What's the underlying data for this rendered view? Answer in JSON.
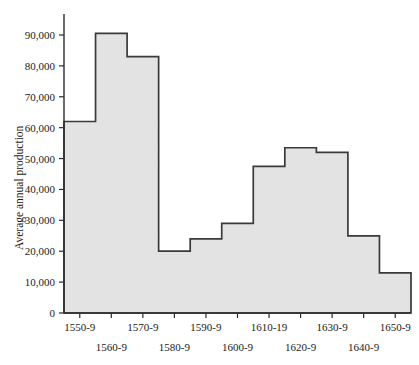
{
  "chart_data": {
    "type": "bar",
    "title": "",
    "subtitle": "",
    "xlabel": "",
    "ylabel": "Average annual production",
    "categories": [
      "1550-9",
      "1560-9",
      "1570-9",
      "1580-9",
      "1590-9",
      "1600-9",
      "1610-19",
      "1620-9",
      "1630-9",
      "1640-9",
      "1650-9"
    ],
    "values": [
      62000,
      90500,
      83000,
      20000,
      24000,
      29000,
      47500,
      53500,
      52000,
      25000,
      13000
    ],
    "ylim": [
      0,
      95000
    ],
    "yticks": [
      0,
      10000,
      20000,
      30000,
      40000,
      50000,
      60000,
      70000,
      80000,
      90000
    ],
    "ytick_labels": [
      "0",
      "10,000",
      "20,000",
      "30,000",
      "40,000",
      "50,000",
      "60,000",
      "70,000",
      "80,000",
      "90,000"
    ],
    "xtick_labels_row_top": [
      "1550-9",
      "1570-9",
      "1590-9",
      "1610-19",
      "1630-9",
      "1650-9"
    ],
    "xtick_labels_row_bottom": [
      "1560-9",
      "1580-9",
      "1600-9",
      "1620-9",
      "1640-9"
    ],
    "grid": false,
    "legend": "none",
    "bar_fill_color": "#e3e3e3",
    "bar_outline_color": "#3a3a3a",
    "axis_color": "#2b2b2b",
    "background_color": "#ffffff"
  },
  "axes": {
    "y_title": "Average annual production"
  }
}
